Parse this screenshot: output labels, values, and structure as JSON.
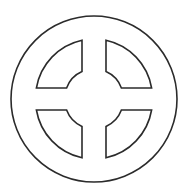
{
  "figure": {
    "stroke_color": "#2b2b2b",
    "fill_color": "#ffffff",
    "background": "#ffffff"
  }
}
